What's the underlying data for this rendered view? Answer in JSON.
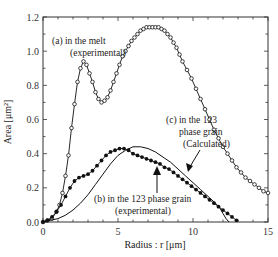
{
  "chart_data": {
    "type": "line",
    "title": "",
    "xlabel": "Radius : r [μm]",
    "ylabel": "Area [μm²]",
    "xlim": [
      0,
      15
    ],
    "ylim": [
      0.0,
      1.2
    ],
    "xticks": [
      "0",
      "5",
      "10",
      "15"
    ],
    "yticks": [
      "0.0",
      "0.2",
      "0.4",
      "0.6",
      "0.8",
      "1.0",
      "1.2"
    ],
    "grid": false,
    "legend": "none (inline annotations)",
    "series": [
      {
        "name": "(a) in the melt (experimental)",
        "marker": "open-circle",
        "x": [
          0.0,
          0.3,
          0.6,
          0.9,
          1.1,
          1.3,
          1.5,
          1.7,
          1.9,
          2.1,
          2.3,
          2.5,
          2.7,
          2.9,
          3.1,
          3.3,
          3.5,
          3.7,
          3.9,
          4.1,
          4.3,
          4.5,
          4.7,
          4.9,
          5.1,
          5.3,
          5.5,
          5.7,
          5.9,
          6.1,
          6.3,
          6.5,
          6.7,
          6.9,
          7.1,
          7.3,
          7.5,
          7.7,
          7.9,
          8.1,
          8.3,
          8.5,
          8.7,
          8.9,
          9.1,
          9.3,
          9.6,
          9.9,
          10.2,
          10.5,
          10.8,
          11.1,
          11.4,
          11.7,
          12.0,
          12.3,
          12.6,
          12.9,
          13.2,
          13.5,
          13.8,
          14.1,
          14.4,
          14.7,
          15.0
        ],
        "y": [
          0.0,
          0.01,
          0.02,
          0.06,
          0.1,
          0.17,
          0.27,
          0.39,
          0.55,
          0.69,
          0.82,
          0.9,
          0.94,
          0.92,
          0.87,
          0.82,
          0.76,
          0.72,
          0.7,
          0.71,
          0.73,
          0.77,
          0.82,
          0.87,
          0.92,
          0.97,
          1.0,
          1.03,
          1.06,
          1.08,
          1.1,
          1.12,
          1.13,
          1.14,
          1.14,
          1.14,
          1.14,
          1.14,
          1.13,
          1.12,
          1.1,
          1.08,
          1.05,
          1.02,
          0.98,
          0.94,
          0.89,
          0.84,
          0.78,
          0.72,
          0.66,
          0.6,
          0.54,
          0.49,
          0.44,
          0.4,
          0.36,
          0.32,
          0.29,
          0.26,
          0.24,
          0.22,
          0.2,
          0.18,
          0.17
        ]
      },
      {
        "name": "(b) in the 123 phase grain (experimental)",
        "marker": "filled-circle",
        "x": [
          0.0,
          0.3,
          0.6,
          0.9,
          1.2,
          1.5,
          1.8,
          2.1,
          2.4,
          2.7,
          3.0,
          3.3,
          3.6,
          3.9,
          4.2,
          4.5,
          4.8,
          5.1,
          5.4,
          5.7,
          6.0,
          6.3,
          6.6,
          6.9,
          7.2,
          7.5,
          7.8,
          8.1,
          8.4,
          8.7,
          9.0,
          9.3,
          9.6,
          9.9,
          10.2,
          10.5,
          10.8,
          11.1,
          11.4,
          11.7,
          12.0,
          12.3,
          12.6,
          12.9
        ],
        "y": [
          0.0,
          0.01,
          0.03,
          0.06,
          0.1,
          0.15,
          0.2,
          0.24,
          0.26,
          0.27,
          0.28,
          0.3,
          0.33,
          0.36,
          0.39,
          0.41,
          0.42,
          0.43,
          0.43,
          0.42,
          0.4,
          0.39,
          0.38,
          0.37,
          0.36,
          0.35,
          0.34,
          0.32,
          0.31,
          0.29,
          0.27,
          0.25,
          0.23,
          0.21,
          0.19,
          0.17,
          0.15,
          0.13,
          0.11,
          0.09,
          0.07,
          0.05,
          0.03,
          0.01
        ]
      },
      {
        "name": "(c) in the 123 phase grain (Calculated)",
        "marker": "none",
        "x": [
          0.0,
          0.5,
          1.0,
          1.5,
          2.0,
          2.5,
          3.0,
          3.5,
          4.0,
          4.5,
          5.0,
          5.5,
          6.0,
          6.5,
          7.0,
          7.5,
          8.0,
          8.5,
          9.0,
          9.5,
          10.0,
          10.5,
          11.0,
          11.5,
          11.8,
          12.0,
          12.2,
          12.4
        ],
        "y": [
          0.0,
          0.01,
          0.02,
          0.04,
          0.07,
          0.11,
          0.16,
          0.22,
          0.28,
          0.34,
          0.39,
          0.42,
          0.44,
          0.44,
          0.43,
          0.41,
          0.38,
          0.35,
          0.31,
          0.27,
          0.23,
          0.19,
          0.15,
          0.11,
          0.08,
          0.05,
          0.02,
          0.0
        ]
      }
    ],
    "annotations": [
      {
        "text": "(a) in the melt",
        "line2": "(experimental)"
      },
      {
        "text": "(c) in the 123",
        "line2": "phase grain",
        "line3": "(Calculated)"
      },
      {
        "text": "(b) in the 123 phase grain",
        "line2": "(experimental)"
      }
    ]
  }
}
